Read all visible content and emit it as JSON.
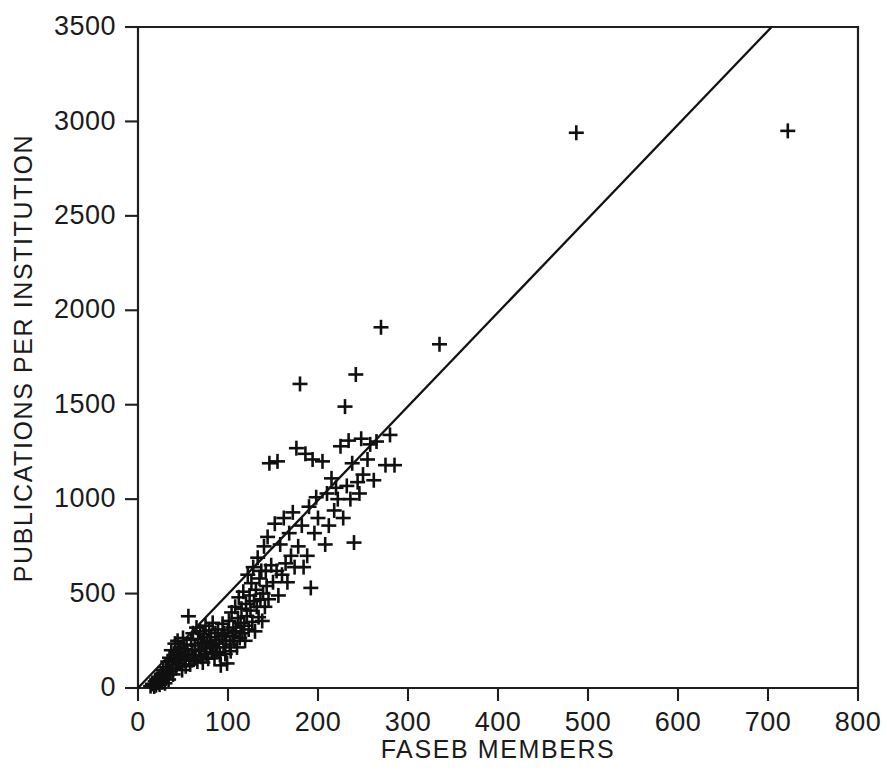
{
  "figure": {
    "title": "",
    "background_color": "#ffffff",
    "ink_color": "#1a1a1a"
  },
  "axis_titles": {
    "x": "FASEB MEMBERS",
    "y": "PUBLICATIONS PER INSTITUTION"
  },
  "ticks": {
    "x_labels": [
      "0",
      "100",
      "200",
      "300",
      "400",
      "500",
      "600",
      "700",
      "800"
    ],
    "y_labels": [
      "0",
      "500",
      "1000",
      "1500",
      "2000",
      "2500",
      "3000",
      "3500"
    ]
  },
  "chart_data": {
    "type": "scatter",
    "title": "",
    "xlabel": "FASEB MEMBERS",
    "ylabel": "PUBLICATIONS PER INSTITUTION",
    "xlim": [
      0,
      800
    ],
    "ylim": [
      0,
      3500
    ],
    "xticks": [
      0,
      100,
      200,
      300,
      400,
      500,
      600,
      700,
      800
    ],
    "yticks": [
      0,
      500,
      1000,
      1500,
      2000,
      2500,
      3000,
      3500
    ],
    "grid": false,
    "legend": null,
    "marker": "plus",
    "marker_color": "#101010",
    "series": [
      {
        "name": "Institutions",
        "points": [
          [
            14,
            10
          ],
          [
            16,
            22
          ],
          [
            18,
            8
          ],
          [
            19,
            35
          ],
          [
            20,
            15
          ],
          [
            21,
            48
          ],
          [
            22,
            28
          ],
          [
            23,
            60
          ],
          [
            24,
            18
          ],
          [
            25,
            42
          ],
          [
            26,
            75
          ],
          [
            27,
            30
          ],
          [
            28,
            95
          ],
          [
            29,
            55
          ],
          [
            30,
            25
          ],
          [
            31,
            110
          ],
          [
            32,
            68
          ],
          [
            33,
            140
          ],
          [
            34,
            45
          ],
          [
            35,
            160
          ],
          [
            36,
            88
          ],
          [
            37,
            200
          ],
          [
            38,
            120
          ],
          [
            39,
            72
          ],
          [
            40,
            175
          ],
          [
            41,
            235
          ],
          [
            42,
            105
          ],
          [
            43,
            150
          ],
          [
            44,
            250
          ],
          [
            45,
            190
          ],
          [
            46,
            130
          ],
          [
            47,
            215
          ],
          [
            48,
            170
          ],
          [
            49,
            95
          ],
          [
            50,
            265
          ],
          [
            51,
            205
          ],
          [
            52,
            145
          ],
          [
            53,
            115
          ],
          [
            54,
            230
          ],
          [
            55,
            180
          ],
          [
            56,
            380
          ],
          [
            57,
            160
          ],
          [
            58,
            125
          ],
          [
            59,
            255
          ],
          [
            60,
            200
          ],
          [
            61,
            290
          ],
          [
            62,
            150
          ],
          [
            63,
            225
          ],
          [
            64,
            175
          ],
          [
            65,
            320
          ],
          [
            66,
            140
          ],
          [
            67,
            260
          ],
          [
            68,
            195
          ],
          [
            69,
            300
          ],
          [
            70,
            165
          ],
          [
            71,
            240
          ],
          [
            72,
            135
          ],
          [
            73,
            285
          ],
          [
            74,
            210
          ],
          [
            75,
            330
          ],
          [
            76,
            180
          ],
          [
            77,
            250
          ],
          [
            78,
            155
          ],
          [
            79,
            305
          ],
          [
            80,
            225
          ],
          [
            81,
            270
          ],
          [
            82,
            190
          ],
          [
            83,
            345
          ],
          [
            84,
            215
          ],
          [
            85,
            160
          ],
          [
            86,
            290
          ],
          [
            87,
            235
          ],
          [
            88,
            190
          ],
          [
            89,
            310
          ],
          [
            90,
            255
          ],
          [
            91,
            175
          ],
          [
            92,
            120
          ],
          [
            93,
            275
          ],
          [
            94,
            340
          ],
          [
            95,
            215
          ],
          [
            96,
            290
          ],
          [
            97,
            180
          ],
          [
            98,
            250
          ],
          [
            99,
            130
          ],
          [
            100,
            305
          ],
          [
            101,
            355
          ],
          [
            102,
            230
          ],
          [
            103,
            195
          ],
          [
            104,
            400
          ],
          [
            105,
            275
          ],
          [
            106,
            320
          ],
          [
            107,
            250
          ],
          [
            108,
            430
          ],
          [
            109,
            300
          ],
          [
            110,
            215
          ],
          [
            111,
            370
          ],
          [
            112,
            480
          ],
          [
            113,
            265
          ],
          [
            114,
            345
          ],
          [
            115,
            420
          ],
          [
            116,
            290
          ],
          [
            117,
            510
          ],
          [
            118,
            330
          ],
          [
            119,
            250
          ],
          [
            120,
            445
          ],
          [
            121,
            380
          ],
          [
            122,
            600
          ],
          [
            123,
            310
          ],
          [
            124,
            490
          ],
          [
            125,
            410
          ],
          [
            126,
            555
          ],
          [
            127,
            350
          ],
          [
            128,
            640
          ],
          [
            129,
            460
          ],
          [
            130,
            300
          ],
          [
            131,
            520
          ],
          [
            132,
            430
          ],
          [
            133,
            690
          ],
          [
            134,
            375
          ],
          [
            135,
            580
          ],
          [
            136,
            470
          ],
          [
            137,
            620
          ],
          [
            138,
            355
          ],
          [
            139,
            500
          ],
          [
            140,
            750
          ],
          [
            141,
            430
          ],
          [
            142,
            620
          ],
          [
            143,
            540
          ],
          [
            144,
            800
          ],
          [
            145,
            470
          ],
          [
            146,
            1190
          ],
          [
            148,
            650
          ],
          [
            150,
            560
          ],
          [
            152,
            870
          ],
          [
            154,
            620
          ],
          [
            155,
            1200
          ],
          [
            156,
            490
          ],
          [
            158,
            760
          ],
          [
            160,
            600
          ],
          [
            162,
            900
          ],
          [
            164,
            660
          ],
          [
            166,
            560
          ],
          [
            168,
            820
          ],
          [
            170,
            700
          ],
          [
            172,
            930
          ],
          [
            174,
            640
          ],
          [
            176,
            1270
          ],
          [
            178,
            750
          ],
          [
            180,
            1610
          ],
          [
            182,
            860
          ],
          [
            184,
            640
          ],
          [
            186,
            1240
          ],
          [
            188,
            700
          ],
          [
            190,
            960
          ],
          [
            192,
            530
          ],
          [
            194,
            1210
          ],
          [
            196,
            820
          ],
          [
            198,
            1010
          ],
          [
            200,
            900
          ],
          [
            205,
            1200
          ],
          [
            208,
            760
          ],
          [
            210,
            1030
          ],
          [
            212,
            860
          ],
          [
            215,
            1110
          ],
          [
            218,
            940
          ],
          [
            220,
            1060
          ],
          [
            222,
            1000
          ],
          [
            225,
            1280
          ],
          [
            228,
            900
          ],
          [
            230,
            1490
          ],
          [
            232,
            1070
          ],
          [
            234,
            1310
          ],
          [
            236,
            1000
          ],
          [
            238,
            1190
          ],
          [
            240,
            770
          ],
          [
            242,
            1660
          ],
          [
            244,
            1090
          ],
          [
            246,
            1030
          ],
          [
            248,
            1320
          ],
          [
            250,
            1130
          ],
          [
            255,
            1210
          ],
          [
            258,
            1290
          ],
          [
            262,
            1100
          ],
          [
            265,
            1305
          ],
          [
            270,
            1910
          ],
          [
            275,
            1180
          ],
          [
            280,
            1340
          ],
          [
            285,
            1180
          ],
          [
            335,
            1820
          ],
          [
            487,
            2940
          ],
          [
            722,
            2950
          ]
        ]
      }
    ],
    "fit_line": {
      "name": "regression line",
      "x_start": 0,
      "y_start": 0,
      "x_end": 704,
      "y_end": 3500,
      "slope": 4.97,
      "intercept": 0
    }
  }
}
